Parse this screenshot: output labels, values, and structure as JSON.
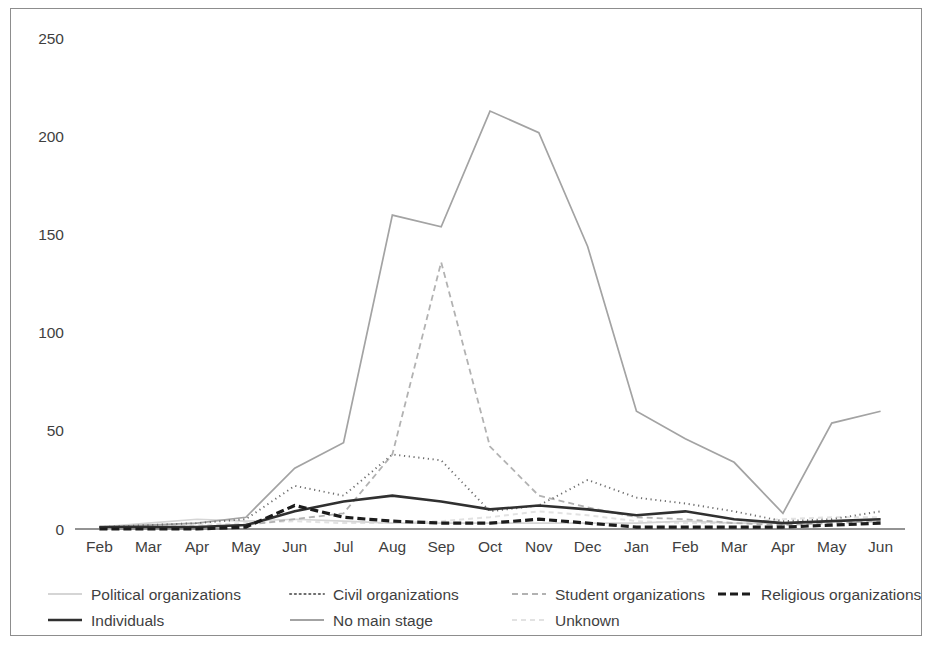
{
  "figure": {
    "frame_color": "#8d8d8d",
    "background": "#ffffff",
    "axis_color": "#6f6f6f",
    "text_color": "#3f3f3f"
  },
  "chart_data": {
    "type": "line",
    "title": "",
    "subtitle": "",
    "xlabel": "",
    "ylabel": "",
    "ylim": [
      0,
      250
    ],
    "yticks": [
      0,
      50,
      100,
      150,
      200,
      250
    ],
    "ytick_labels": [
      "0",
      "50",
      "100",
      "150",
      "200",
      "250"
    ],
    "grid": false,
    "legend_position": "bottom",
    "categories": [
      "Feb",
      "Mar",
      "Apr",
      "May",
      "Jun",
      "Jul",
      "Aug",
      "Sep",
      "Oct",
      "Nov",
      "Dec",
      "Jan",
      "Feb",
      "Mar",
      "Apr",
      "May",
      "Jun"
    ],
    "series": [
      {
        "name": "Political organizations",
        "color": "#d5d5d5",
        "style": "solid",
        "width": 1.6,
        "dash": "",
        "values": [
          1,
          3,
          5,
          4,
          5,
          4,
          3,
          3,
          3,
          3,
          3,
          3,
          4,
          3,
          3,
          4,
          5
        ]
      },
      {
        "name": "Civil organizations",
        "color": "#6d6d6d",
        "style": "dotted",
        "width": 1.9,
        "dash": "1.2,3.6",
        "values": [
          1,
          2,
          3,
          5,
          22,
          17,
          38,
          35,
          9,
          12,
          25,
          16,
          13,
          9,
          4,
          5,
          9
        ]
      },
      {
        "name": "Student organizations",
        "color": "#b2b2b2",
        "style": "dashed",
        "width": 1.8,
        "dash": "6,4",
        "values": [
          0,
          1,
          1,
          2,
          5,
          8,
          38,
          136,
          42,
          17,
          11,
          6,
          5,
          3,
          2,
          3,
          4
        ]
      },
      {
        "name": "Religious organizations",
        "color": "#1c1c1c",
        "style": "dashed-thick",
        "width": 3.2,
        "dash": "8,4",
        "values": [
          0,
          0,
          0,
          1,
          12,
          6,
          4,
          3,
          3,
          5,
          3,
          1,
          1,
          1,
          1,
          2,
          3
        ]
      },
      {
        "name": "Individuals",
        "color": "#303030",
        "style": "solid",
        "width": 2.6,
        "dash": "",
        "values": [
          1,
          1,
          1,
          2,
          9,
          14,
          17,
          14,
          10,
          12,
          10,
          7,
          9,
          5,
          3,
          4,
          5
        ]
      },
      {
        "name": "No main stage",
        "color": "#a3a3a3",
        "style": "solid",
        "width": 1.7,
        "dash": "",
        "values": [
          1,
          2,
          3,
          6,
          31,
          44,
          160,
          154,
          213,
          202,
          144,
          60,
          46,
          34,
          8,
          54,
          60
        ]
      },
      {
        "name": "Unknown",
        "color": "#e2e2e2",
        "style": "dashed",
        "width": 2.0,
        "dash": "5,4",
        "values": [
          0,
          1,
          2,
          3,
          4,
          3,
          3,
          4,
          6,
          9,
          7,
          4,
          3,
          3,
          5,
          6,
          6
        ]
      }
    ]
  },
  "legend": {
    "rows": [
      [
        "Political organizations",
        "Civil organizations",
        "Student organizations",
        "Religious organizations"
      ],
      [
        "Individuals",
        "No main stage",
        "Unknown"
      ]
    ]
  }
}
